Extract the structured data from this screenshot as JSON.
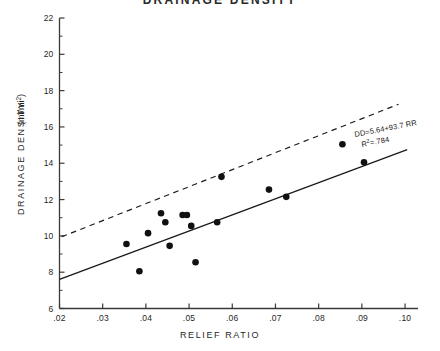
{
  "chart_data": {
    "type": "scatter",
    "title": "DRAINAGE DENSITY",
    "xlabel": "RELIEF RATIO",
    "ylabel": "DRAINAGE DENSITY",
    "ylabel_units": "(mi/mi²)",
    "xlim": [
      0.02,
      0.103
    ],
    "ylim": [
      6,
      22
    ],
    "grid": false,
    "legend": "none",
    "xticks": [
      0.02,
      0.03,
      0.04,
      0.05,
      0.06,
      0.07,
      0.08,
      0.09,
      0.1
    ],
    "xtick_labels": [
      ".02",
      ".03",
      ".04",
      ".05",
      ".06",
      ".07",
      ".08",
      ".09",
      ".10"
    ],
    "yticks": [
      6,
      8,
      10,
      12,
      14,
      16,
      18,
      20,
      22
    ],
    "ytick_labels": [
      "6",
      "8",
      "10",
      "12",
      "14",
      "16",
      "18",
      "20",
      "22"
    ],
    "y_minor_ticks": [
      7,
      9,
      11,
      13,
      15,
      17,
      19,
      21
    ],
    "points": [
      {
        "x": 0.0355,
        "y": 9.55
      },
      {
        "x": 0.0385,
        "y": 8.05
      },
      {
        "x": 0.0405,
        "y": 10.15
      },
      {
        "x": 0.0435,
        "y": 11.25
      },
      {
        "x": 0.0445,
        "y": 10.75
      },
      {
        "x": 0.0455,
        "y": 9.45
      },
      {
        "x": 0.0485,
        "y": 11.15
      },
      {
        "x": 0.0495,
        "y": 11.15
      },
      {
        "x": 0.0505,
        "y": 10.55
      },
      {
        "x": 0.0515,
        "y": 8.55
      },
      {
        "x": 0.0565,
        "y": 10.75
      },
      {
        "x": 0.0575,
        "y": 13.25
      },
      {
        "x": 0.0685,
        "y": 12.55
      },
      {
        "x": 0.0725,
        "y": 12.15
      },
      {
        "x": 0.0855,
        "y": 15.05
      },
      {
        "x": 0.0905,
        "y": 14.05
      }
    ],
    "regression_line": {
      "style": "solid",
      "equation": "DD=5.64+93.7 RR",
      "r_squared_label": "R",
      "r_squared_exp": "2",
      "r_squared_value": "=.784",
      "x_start": 0.02,
      "y_start": 7.6,
      "x_end": 0.1005,
      "y_end": 14.75
    },
    "reference_line": {
      "style": "dashed",
      "x_start": 0.0205,
      "y_start": 9.95,
      "x_end": 0.0985,
      "y_end": 17.25
    },
    "marker": {
      "shape": "circle",
      "color": "#111111",
      "size": 3.3
    },
    "line_color": "#1a1a1a",
    "axis_color": "#3a3a3a"
  }
}
